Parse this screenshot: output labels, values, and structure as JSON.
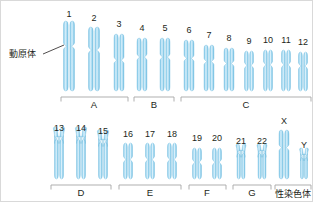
{
  "figure": {
    "background_color": "#ffffff",
    "border_color": "#d9d9d9",
    "chromosome_fill": "#8ecdea",
    "chromosome_highlight": "#cfe9f7",
    "chromosome_edge": "#6fb9dd",
    "bracket_color": "#a6a6a6",
    "text_color": "#231f20"
  },
  "annotations": {
    "centromere_label": "動原体"
  },
  "chromosomes": [
    {
      "id": "1",
      "label": "1",
      "cx": 68,
      "label_y": 16,
      "arm_top": 38,
      "arm_bottom": 44,
      "width": 11,
      "top_y": 20,
      "bottom_y": 90,
      "style": "submetacentric",
      "row": "top"
    },
    {
      "id": "2",
      "label": "2",
      "cx": 93,
      "label_y": 20,
      "arm_top": 32,
      "arm_bottom": 38,
      "width": 11,
      "top_y": 26,
      "bottom_y": 90,
      "style": "submetacentric",
      "row": "top"
    },
    {
      "id": "3",
      "label": "3",
      "cx": 118,
      "label_y": 26,
      "arm_top": 30,
      "arm_bottom": 36,
      "width": 10,
      "top_y": 33,
      "bottom_y": 90,
      "style": "metacentric",
      "row": "top"
    },
    {
      "id": "4",
      "label": "4",
      "cx": 141,
      "label_y": 30,
      "arm_top": 27,
      "arm_bottom": 33,
      "width": 10,
      "top_y": 37,
      "bottom_y": 90,
      "style": "submetacentric",
      "row": "top"
    },
    {
      "id": "5",
      "label": "5",
      "cx": 164,
      "label_y": 30,
      "arm_top": 27,
      "arm_bottom": 33,
      "width": 10,
      "top_y": 37,
      "bottom_y": 90,
      "style": "submetacentric",
      "row": "top"
    },
    {
      "id": "6",
      "label": "6",
      "cx": 188,
      "label_y": 32,
      "arm_top": 25,
      "arm_bottom": 31,
      "width": 10,
      "top_y": 39,
      "bottom_y": 90,
      "style": "submetacentric",
      "row": "top"
    },
    {
      "id": "7",
      "label": "7",
      "cx": 208,
      "label_y": 37,
      "arm_top": 23,
      "arm_bottom": 29,
      "width": 10,
      "top_y": 44,
      "bottom_y": 90,
      "style": "submetacentric",
      "row": "top"
    },
    {
      "id": "8",
      "label": "8",
      "cx": 228,
      "label_y": 40,
      "arm_top": 21,
      "arm_bottom": 27,
      "width": 10,
      "top_y": 47,
      "bottom_y": 90,
      "style": "submetacentric",
      "row": "top"
    },
    {
      "id": "9",
      "label": "9",
      "cx": 248,
      "label_y": 43,
      "arm_top": 20,
      "arm_bottom": 26,
      "width": 9,
      "top_y": 50,
      "bottom_y": 90,
      "style": "submetacentric",
      "row": "top"
    },
    {
      "id": "10",
      "label": "10",
      "cx": 267,
      "label_y": 42,
      "arm_top": 20,
      "arm_bottom": 26,
      "width": 9,
      "top_y": 49,
      "bottom_y": 90,
      "style": "submetacentric",
      "row": "top"
    },
    {
      "id": "11",
      "label": "11",
      "cx": 285,
      "label_y": 42,
      "arm_top": 20,
      "arm_bottom": 26,
      "width": 9,
      "top_y": 49,
      "bottom_y": 90,
      "style": "submetacentric",
      "row": "top"
    },
    {
      "id": "12",
      "label": "12",
      "cx": 302,
      "label_y": 44,
      "arm_top": 18,
      "arm_bottom": 24,
      "width": 9,
      "top_y": 51,
      "bottom_y": 90,
      "style": "submetacentric",
      "row": "top"
    },
    {
      "id": "13",
      "label": "13",
      "cx": 58,
      "label_y": 130,
      "arm_top": 10,
      "arm_bottom": 16,
      "width": 9,
      "top_y": 136,
      "bottom_y": 178,
      "style": "acrocentric",
      "row": "bottom"
    },
    {
      "id": "14",
      "label": "14",
      "cx": 80,
      "label_y": 130,
      "arm_top": 10,
      "arm_bottom": 16,
      "width": 9,
      "top_y": 136,
      "bottom_y": 178,
      "style": "acrocentric",
      "row": "bottom"
    },
    {
      "id": "15",
      "label": "15",
      "cx": 102,
      "label_y": 133,
      "arm_top": 10,
      "arm_bottom": 16,
      "width": 9,
      "top_y": 139,
      "bottom_y": 178,
      "style": "acrocentric",
      "row": "bottom"
    },
    {
      "id": "16",
      "label": "16",
      "cx": 127,
      "label_y": 136,
      "arm_top": 14,
      "arm_bottom": 18,
      "width": 9,
      "top_y": 142,
      "bottom_y": 178,
      "style": "metacentric",
      "row": "bottom"
    },
    {
      "id": "17",
      "label": "17",
      "cx": 149,
      "label_y": 136,
      "arm_top": 14,
      "arm_bottom": 18,
      "width": 9,
      "top_y": 142,
      "bottom_y": 178,
      "style": "metacentric",
      "row": "bottom"
    },
    {
      "id": "18",
      "label": "18",
      "cx": 171,
      "label_y": 136,
      "arm_top": 14,
      "arm_bottom": 18,
      "width": 9,
      "top_y": 142,
      "bottom_y": 178,
      "style": "metacentric",
      "row": "bottom"
    },
    {
      "id": "19",
      "label": "19",
      "cx": 196,
      "label_y": 140,
      "arm_top": 12,
      "arm_bottom": 16,
      "width": 9,
      "top_y": 147,
      "bottom_y": 178,
      "style": "metacentric",
      "row": "bottom"
    },
    {
      "id": "20",
      "label": "20",
      "cx": 216,
      "label_y": 140,
      "arm_top": 12,
      "arm_bottom": 16,
      "width": 9,
      "top_y": 147,
      "bottom_y": 178,
      "style": "metacentric",
      "row": "bottom"
    },
    {
      "id": "21",
      "label": "21",
      "cx": 240,
      "label_y": 143,
      "arm_top": 6,
      "arm_bottom": 12,
      "width": 8,
      "top_y": 150,
      "bottom_y": 178,
      "style": "acrocentric",
      "row": "bottom"
    },
    {
      "id": "22",
      "label": "22",
      "cx": 261,
      "label_y": 143,
      "arm_top": 6,
      "arm_bottom": 12,
      "width": 8,
      "top_y": 150,
      "bottom_y": 178,
      "style": "acrocentric",
      "row": "bottom"
    },
    {
      "id": "X",
      "label": "X",
      "cx": 283,
      "label_y": 123,
      "arm_top": 16,
      "arm_bottom": 22,
      "width": 10,
      "top_y": 129,
      "bottom_y": 178,
      "style": "submetacentric",
      "row": "bottom"
    },
    {
      "id": "Y",
      "label": "Y",
      "cx": 303,
      "label_y": 147,
      "arm_top": 5,
      "arm_bottom": 10,
      "width": 7,
      "top_y": 154,
      "bottom_y": 178,
      "style": "acrocentric",
      "row": "bottom"
    }
  ],
  "groups": [
    {
      "id": "A",
      "label": "A",
      "x1": 60,
      "x2": 127,
      "y": 96,
      "label_x": 93,
      "label_y": 107,
      "row": "top"
    },
    {
      "id": "B",
      "label": "B",
      "x1": 133,
      "x2": 173,
      "y": 96,
      "label_x": 153,
      "label_y": 107,
      "row": "top"
    },
    {
      "id": "C",
      "label": "C",
      "x1": 180,
      "x2": 310,
      "y": 96,
      "label_x": 245,
      "label_y": 107,
      "row": "top"
    },
    {
      "id": "D",
      "label": "D",
      "x1": 50,
      "x2": 110,
      "y": 184,
      "label_x": 80,
      "label_y": 195,
      "row": "bottom"
    },
    {
      "id": "E",
      "label": "E",
      "x1": 118,
      "x2": 180,
      "y": 184,
      "label_x": 149,
      "label_y": 195,
      "row": "bottom"
    },
    {
      "id": "F",
      "label": "F",
      "x1": 188,
      "x2": 225,
      "y": 184,
      "label_x": 206,
      "label_y": 195,
      "row": "bottom"
    },
    {
      "id": "G",
      "label": "G",
      "x1": 232,
      "x2": 270,
      "y": 184,
      "label_x": 251,
      "label_y": 195,
      "row": "bottom"
    },
    {
      "id": "sex",
      "label": "性染色体",
      "x1": 274,
      "x2": 310,
      "y": 184,
      "label_x": 292,
      "label_y": 196,
      "row": "bottom"
    }
  ],
  "centromere_pointer": {
    "text_x": 8,
    "text_y": 55,
    "line_from_x": 42,
    "line_from_y": 53,
    "line_to_x": 63,
    "line_to_y": 44
  }
}
